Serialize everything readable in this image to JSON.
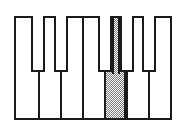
{
  "figure": {
    "description": "A one-octave piano keyboard drawn in line art with seven white keys and five black keys. The fifth white key from the left is filled with a grey checkerboard shading to highlight it.",
    "type": "line-drawing"
  },
  "colors": {
    "background": "#ffffff",
    "stroke": "#1a1a1a",
    "key_fill": "#ffffff",
    "shade_fill": "#7a7a7a",
    "shade_pattern": "checkerboard-50"
  },
  "frame": {
    "x": 14,
    "y": 16,
    "width": 158,
    "height": 104,
    "stroke_width": 2
  },
  "keyboard": {
    "white_key_count": 7,
    "black_key_count": 5,
    "black_key_band_height": 56,
    "white_keys": [
      {
        "index": 0,
        "name": "white-key-1",
        "left": 0,
        "width": 22.0,
        "shaded": false
      },
      {
        "index": 1,
        "name": "white-key-2",
        "left": 22.0,
        "width": 22.0,
        "shaded": false
      },
      {
        "index": 2,
        "name": "white-key-3",
        "left": 44.0,
        "width": 22.0,
        "shaded": false
      },
      {
        "index": 3,
        "name": "white-key-4",
        "left": 66.0,
        "width": 22.0,
        "shaded": false
      },
      {
        "index": 4,
        "name": "white-key-5",
        "left": 88.0,
        "width": 22.0,
        "shaded": true
      },
      {
        "index": 5,
        "name": "white-key-6",
        "left": 110.0,
        "width": 22.0,
        "shaded": false
      },
      {
        "index": 6,
        "name": "white-key-7",
        "left": 132.0,
        "width": 22.0,
        "shaded": false
      }
    ],
    "black_keys": [
      {
        "index": 0,
        "name": "black-key-1",
        "left": 15.0,
        "width": 14.0
      },
      {
        "index": 1,
        "name": "black-key-2",
        "left": 38.0,
        "width": 14.0
      },
      {
        "index": 2,
        "name": "black-key-3",
        "left": 82.0,
        "width": 14.0
      },
      {
        "index": 3,
        "name": "black-key-4",
        "left": 104.0,
        "width": 14.0
      },
      {
        "index": 4,
        "name": "black-key-5",
        "left": 126.0,
        "width": 14.0
      }
    ],
    "highlight": {
      "white_key_index": 4,
      "upper_left": 96.0,
      "upper_width": 8.0,
      "upper_height": 56.0
    }
  }
}
